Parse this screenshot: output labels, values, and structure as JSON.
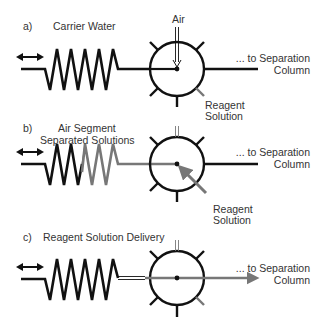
{
  "panels": [
    {
      "letter": "a)",
      "title": "Carrier Water",
      "air_label": "Air",
      "output_label_line1": "... to Separation",
      "output_label_line2": "Column",
      "reagent_label_line1": "Reagent",
      "reagent_label_line2": "Solution"
    },
    {
      "letter": "b)",
      "title_line1": "Air Segment",
      "title_line2": "Separated Solutions",
      "output_label_line1": "... to Separation",
      "output_label_line2": "Column",
      "reagent_label_line1": "Reagent",
      "reagent_label_line2": "Solution"
    },
    {
      "letter": "c)",
      "title": "Reagent Solution Delivery",
      "output_label_line1": "... to Separation",
      "output_label_line2": "Column"
    }
  ],
  "colors": {
    "line": "#111111",
    "reagent": "#777777",
    "text": "#333333"
  }
}
